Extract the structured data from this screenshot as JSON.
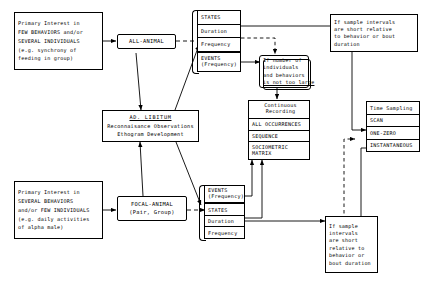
{
  "diagram": {
    "premise_all": {
      "l1": "Primary Interest in",
      "l2": "FEW BEHAVIORS and/or",
      "l3": "SEVERAL INDIVIDUALS",
      "l4": "(e.g. synchrony of",
      "l5": "feeding in group)"
    },
    "premise_focal": {
      "l1": "Primary Interest in",
      "l2": "SEVERAL BEHAVIORS",
      "l3": "and/or FEW INDIVIDUALS",
      "l4": "(e.g. daily activities",
      "l5": "of alpha male)"
    },
    "all_animal": {
      "l1": "ALL-ANIMAL"
    },
    "focal_animal": {
      "l1": "FOCAL-ANIMAL",
      "l2": "(Pair, Group)"
    },
    "ad_libitum": {
      "l1": "AD. LIBITUM",
      "l2": "Reconnaisance Observations",
      "l3": "Ethogram Development"
    },
    "top_stack": {
      "r1": "STATES",
      "r2": "Duration",
      "r3": "Frequency",
      "r4a": "EVENTS",
      "r4b": "(Frequency)"
    },
    "bottom_stack": {
      "r1a": "EVENTS",
      "r1b": "(Frequency)",
      "r2": "STATES",
      "r3": "Duration",
      "r4": "Frequency"
    },
    "cond_number": {
      "l1": "If number of",
      "l2": "individuals",
      "l3": "and behaviors",
      "l4": "is not too large"
    },
    "cond_sample_top": {
      "l1": "If sample intervals",
      "l2": "are short relative",
      "l3": "to behavior or bout",
      "l4": "duration"
    },
    "cond_sample_bottom": {
      "l1": "If sample",
      "l2": "intervals",
      "l3": "are short",
      "l4": "relative to",
      "l5": "behavior or",
      "l6": "bout duration"
    },
    "continuous": {
      "r1a": "Continuous",
      "r1b": "Recording",
      "r2": "ALL OCCURRENCES",
      "r3": "SEQUENCE",
      "r4a": "SOCIOMETRIC",
      "r4b": "MATRIX"
    },
    "time_sampling": {
      "r1": "Time Sampling",
      "r2": "SCAN",
      "r3": "ONE-ZERO",
      "r4": "INSTANTANEOUS"
    },
    "colors": {
      "ink": "#000000",
      "paper": "#ffffff"
    }
  }
}
